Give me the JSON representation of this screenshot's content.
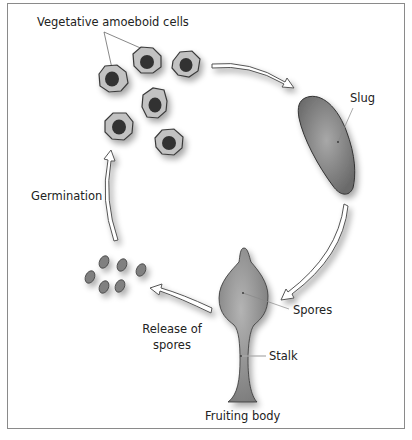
{
  "diagram": {
    "type": "life-cycle",
    "colors": {
      "frame": "#8a8a8a",
      "cell_fill": "#c2c2c2",
      "cell_stroke": "#3a3a3a",
      "nucleus": "#333333",
      "slug_fill": "#7c7c7c",
      "fruiting_fill": "#8a8a8a",
      "spore_fill": "#808080",
      "arrow_stroke": "#555555",
      "arrow_fill": "#ffffff",
      "leader_line": "#888888"
    },
    "labels": {
      "vegetative": "Vegetative amoeboid cells",
      "slug": "Slug",
      "germination": "Germination",
      "spores": "Spores",
      "stalk": "Stalk",
      "release_line1": "Release of",
      "release_line2": "spores",
      "fruiting_body": "Fruiting body"
    },
    "stages": [
      {
        "id": "vegetative",
        "label": "Vegetative amoeboid cells"
      },
      {
        "id": "slug",
        "label": "Slug"
      },
      {
        "id": "fruiting-body",
        "label": "Fruiting body",
        "parts": [
          "Spores",
          "Stalk"
        ]
      },
      {
        "id": "release",
        "label": "Release of spores"
      },
      {
        "id": "germination",
        "label": "Germination"
      }
    ]
  }
}
